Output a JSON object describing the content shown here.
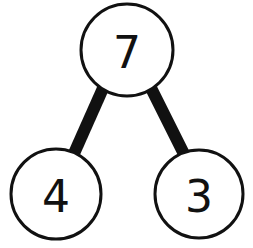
{
  "diagram": {
    "type": "number-bond",
    "colors": {
      "stroke": "#111111",
      "fill": "#ffffff",
      "text": "#111111"
    },
    "whole": {
      "value": "7",
      "cx": 127,
      "cy": 50,
      "r": 46
    },
    "parts": [
      {
        "value": "4",
        "cx": 56,
        "cy": 194,
        "r": 45
      },
      {
        "value": "3",
        "cx": 199,
        "cy": 194,
        "r": 44
      }
    ],
    "connectors": [
      {
        "from": "whole",
        "to": "part-0"
      },
      {
        "from": "whole",
        "to": "part-1"
      }
    ]
  }
}
